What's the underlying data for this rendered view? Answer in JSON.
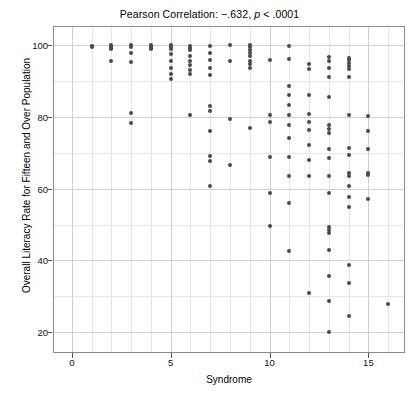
{
  "chart_data": {
    "type": "scatter",
    "title": "Pearson Correlation: −.632, p < .0001",
    "title_prefix": "Pearson Correlation: −.632,",
    "title_italic": "p",
    "title_suffix": "< .0001",
    "xlabel": "Syndrome",
    "ylabel": "Overall Literacy Rate for Fifteen and Over Population",
    "xlim": [
      -0.9,
      16.8
    ],
    "ylim": [
      14.5,
      105
    ],
    "xticks": [
      0,
      5,
      10,
      15
    ],
    "yticks": [
      20,
      40,
      60,
      80,
      100
    ],
    "y_minor_ticks": [
      30,
      50,
      70,
      90
    ],
    "x_minor_ticks": [
      1,
      2,
      3,
      4,
      6,
      7,
      8,
      9,
      11,
      12,
      13,
      14,
      16
    ],
    "grid": true,
    "grid_minor": true,
    "legend": null,
    "marker_color": "#4a4a4a",
    "point_count": 156,
    "points": [
      [
        1,
        99.8
      ],
      [
        1,
        99.4
      ],
      [
        2,
        100.0
      ],
      [
        2,
        99.6
      ],
      [
        2,
        99.2
      ],
      [
        2,
        98.8
      ],
      [
        2,
        95.6
      ],
      [
        3,
        100.0
      ],
      [
        3,
        99.5
      ],
      [
        3,
        97.8
      ],
      [
        3,
        95.3
      ],
      [
        3,
        81.0
      ],
      [
        3,
        78.3
      ],
      [
        4,
        100.0
      ],
      [
        4,
        99.6
      ],
      [
        4,
        99.2
      ],
      [
        4,
        98.8
      ],
      [
        5,
        100.0
      ],
      [
        5,
        99.5
      ],
      [
        5,
        99.0
      ],
      [
        5,
        97.5
      ],
      [
        5,
        95.5
      ],
      [
        5,
        93.5
      ],
      [
        5,
        92.0
      ],
      [
        5,
        90.5
      ],
      [
        6,
        99.8
      ],
      [
        6,
        99.3
      ],
      [
        6,
        98.6
      ],
      [
        6,
        97.0
      ],
      [
        6,
        95.6
      ],
      [
        6,
        94.4
      ],
      [
        6,
        93.0
      ],
      [
        6,
        91.8
      ],
      [
        6,
        80.5
      ],
      [
        7,
        99.6
      ],
      [
        7,
        97.8
      ],
      [
        7,
        95.8
      ],
      [
        7,
        93.6
      ],
      [
        7,
        91.6
      ],
      [
        7,
        83.0
      ],
      [
        7,
        81.5
      ],
      [
        7,
        76.0
      ],
      [
        7,
        69.2
      ],
      [
        7,
        67.6
      ],
      [
        7,
        60.8
      ],
      [
        8,
        100.0
      ],
      [
        8,
        95.5
      ],
      [
        8,
        79.5
      ],
      [
        8,
        66.5
      ],
      [
        9,
        100.0
      ],
      [
        9,
        99.4
      ],
      [
        9,
        98.6
      ],
      [
        9,
        97.8
      ],
      [
        9,
        96.8
      ],
      [
        9,
        95.6
      ],
      [
        9,
        94.6
      ],
      [
        9,
        93.6
      ],
      [
        9,
        76.8
      ],
      [
        10,
        95.8
      ],
      [
        10,
        80.4
      ],
      [
        10,
        78.6
      ],
      [
        10,
        68.8
      ],
      [
        10,
        58.8
      ],
      [
        10,
        49.6
      ],
      [
        11,
        99.8
      ],
      [
        11,
        96.0
      ],
      [
        11,
        88.6
      ],
      [
        11,
        86.0
      ],
      [
        11,
        83.2
      ],
      [
        11,
        80.6
      ],
      [
        11,
        77.8
      ],
      [
        11,
        74.0
      ],
      [
        11,
        68.8
      ],
      [
        11,
        63.6
      ],
      [
        11,
        56.0
      ],
      [
        11,
        42.6
      ],
      [
        12,
        94.6
      ],
      [
        12,
        93.4
      ],
      [
        12,
        86.0
      ],
      [
        12,
        80.8
      ],
      [
        12,
        78.6
      ],
      [
        12,
        76.4
      ],
      [
        12,
        72.2
      ],
      [
        12,
        68.0
      ],
      [
        12,
        63.4
      ],
      [
        12,
        31.0
      ],
      [
        13,
        96.6
      ],
      [
        13,
        95.6
      ],
      [
        13,
        93.6
      ],
      [
        13,
        91.2
      ],
      [
        13,
        85.6
      ],
      [
        13,
        77.8
      ],
      [
        13,
        76.6
      ],
      [
        13,
        75.4
      ],
      [
        13,
        71.0
      ],
      [
        13,
        68.4
      ],
      [
        13,
        63.6
      ],
      [
        13,
        58.8
      ],
      [
        13,
        49.2
      ],
      [
        13,
        48.4
      ],
      [
        13,
        47.6
      ],
      [
        13,
        43.0
      ],
      [
        13,
        35.6
      ],
      [
        13,
        28.6
      ],
      [
        13,
        20.2
      ],
      [
        14,
        96.4
      ],
      [
        14,
        95.8
      ],
      [
        14,
        95.0
      ],
      [
        14,
        94.2
      ],
      [
        14,
        93.4
      ],
      [
        14,
        91.0
      ],
      [
        14,
        80.6
      ],
      [
        14,
        71.2
      ],
      [
        14,
        69.4
      ],
      [
        14,
        64.4
      ],
      [
        14,
        63.6
      ],
      [
        14,
        60.6
      ],
      [
        14,
        57.8
      ],
      [
        14,
        55.0
      ],
      [
        14,
        38.8
      ],
      [
        14,
        33.6
      ],
      [
        14,
        24.4
      ],
      [
        15,
        80.2
      ],
      [
        15,
        76.0
      ],
      [
        15,
        71.0
      ],
      [
        15,
        64.4
      ],
      [
        15,
        63.8
      ],
      [
        15,
        57.0
      ],
      [
        16,
        27.8
      ]
    ]
  }
}
